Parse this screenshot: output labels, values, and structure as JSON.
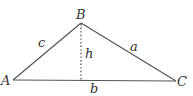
{
  "diagram": {
    "type": "triangle-with-altitude",
    "colors": {
      "line": "#555555",
      "text": "#333333",
      "background": "#ffffff"
    },
    "vertices": [
      {
        "label": "A",
        "x": 13,
        "y": 80
      },
      {
        "label": "B",
        "x": 81,
        "y": 23
      },
      {
        "label": "C",
        "x": 176,
        "y": 81
      }
    ],
    "sides": [
      {
        "label": "c",
        "from": "A",
        "to": "B"
      },
      {
        "label": "a",
        "from": "B",
        "to": "C"
      },
      {
        "label": "b",
        "from": "A",
        "to": "C"
      }
    ],
    "altitude": {
      "label": "h",
      "from": "B",
      "foot_x": 81,
      "foot_y": 80,
      "style": "dotted"
    }
  }
}
